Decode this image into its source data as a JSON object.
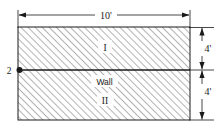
{
  "figure": {
    "type": "engineering-cross-section-diagram",
    "subject": "wall",
    "canvas": {
      "width": 221,
      "height": 131,
      "background": "#ffffff"
    }
  },
  "colors": {
    "line": "#1a1a1a",
    "hatch": "#9a9a9a",
    "fill": "#ffffff",
    "text": "#1a1a1a",
    "node": "#1a1a1a"
  },
  "dimensions": {
    "top": {
      "label": "10'",
      "value": 10,
      "unit": "ft",
      "orientation": "horizontal",
      "position": "top"
    },
    "right_upper": {
      "label": "4'",
      "value": 4,
      "unit": "ft",
      "orientation": "vertical",
      "position": "right"
    },
    "right_lower": {
      "label": "4'",
      "value": 4,
      "unit": "ft",
      "orientation": "vertical",
      "position": "right"
    }
  },
  "regions": [
    {
      "id": "region-1",
      "label": "I",
      "position": "upper",
      "hatched": true
    },
    {
      "id": "region-2",
      "label": "II",
      "position": "lower",
      "hatched": true
    }
  ],
  "annotations": {
    "wall_label": "Wall",
    "node_label": "2"
  },
  "geometry": {
    "rect": {
      "x": 18,
      "y": 27,
      "width": 172,
      "height": 93
    },
    "wall_line_y": 70,
    "node_point": {
      "x": 18,
      "y": 70
    }
  }
}
